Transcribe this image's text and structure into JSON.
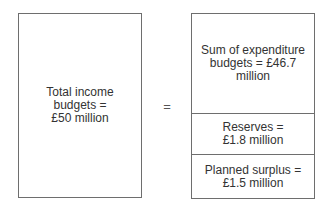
{
  "left_box": {
    "lines": [
      "Total income",
      "budgets =",
      "£50 million"
    ]
  },
  "operator": "=",
  "right_box": {
    "sections": [
      {
        "lines": [
          "Sum of expenditure",
          "budgets = £46.7",
          "million"
        ]
      },
      {
        "lines": [
          "Reserves =",
          "£1.8 million"
        ]
      },
      {
        "lines": [
          "Planned surplus =",
          "£1.5 million"
        ]
      }
    ]
  },
  "colors": {
    "border": "#6e6e6e",
    "text": "#333333",
    "background": "#ffffff"
  }
}
